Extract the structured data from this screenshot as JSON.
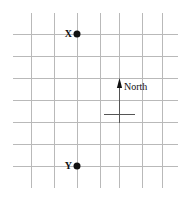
{
  "figure": {
    "kind": "grid-map-diagram",
    "width": 189,
    "height": 210,
    "background_color": "#ffffff"
  },
  "grid": {
    "line_color": "#b9b9b9",
    "line_width": 1,
    "vertical_lines_x": [
      31,
      54,
      77,
      100,
      119,
      142,
      162
    ],
    "horizontal_lines_y": [
      34,
      56,
      78,
      100,
      122,
      144,
      166
    ],
    "vertical_span_y": [
      13,
      188
    ],
    "horizontal_span_x": [
      13,
      178
    ],
    "columns": 7,
    "rows": 7
  },
  "markers": [
    {
      "id": "point-x",
      "label": "X",
      "x": 77,
      "y": 34,
      "dot_color": "#111111",
      "label_color": "#111111"
    },
    {
      "id": "point-y",
      "label": "Y",
      "x": 77,
      "y": 166,
      "dot_color": "#111111",
      "label_color": "#111111"
    }
  ],
  "north_arrow": {
    "label": "North",
    "shaft_x": 119,
    "shaft_top_y": 80,
    "shaft_bottom_y": 123,
    "head_color": "#111111",
    "shaft_color": "#555555",
    "label_x": 124,
    "label_y": 82
  },
  "scale_bar": {
    "id": "scale-bar",
    "x_start": 104,
    "x_end": 135,
    "y": 114,
    "color": "#555555"
  }
}
